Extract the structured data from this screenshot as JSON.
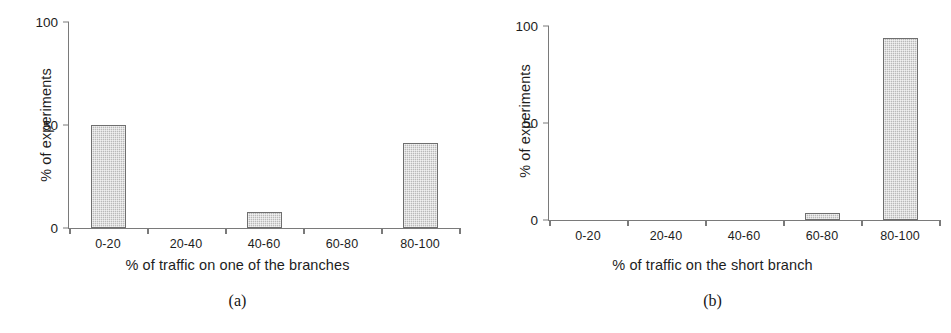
{
  "figure": {
    "panels": [
      {
        "caption": "(a)",
        "ylabel": "% of experiments",
        "xlabel": "% of traffic on one of the branches",
        "categories": [
          "0-20",
          "20-40",
          "40-60",
          "60-80",
          "80-100"
        ],
        "values": [
          50,
          0,
          8,
          0,
          41.5
        ],
        "yticks": [
          "0",
          "50",
          "100"
        ]
      },
      {
        "caption": "(b)",
        "ylabel": "% of experiments",
        "xlabel": "% of traffic on the short branch",
        "categories": [
          "0-20",
          "20-40",
          "40-60",
          "60-80",
          "80-100"
        ],
        "values": [
          0,
          0,
          0,
          3.5,
          94
        ],
        "yticks": [
          "0",
          "50",
          "100"
        ]
      }
    ]
  },
  "chart_data": [
    {
      "type": "bar",
      "panel": "(a)",
      "title": "",
      "xlabel": "% of traffic on one of the branches",
      "ylabel": "% of experiments",
      "categories": [
        "0-20",
        "20-40",
        "40-60",
        "60-80",
        "80-100"
      ],
      "values": [
        50,
        0,
        8,
        0,
        41.5
      ],
      "ylim": [
        0,
        100
      ],
      "ytick_values": [
        0,
        50,
        100
      ],
      "grid": false,
      "legend": "none",
      "bar_fill_color": "#b9b9b9",
      "bar_border_color": "#6f6f6f",
      "axis_color": "#7a7a7a"
    },
    {
      "type": "bar",
      "panel": "(b)",
      "title": "",
      "xlabel": "% of traffic on the short branch",
      "ylabel": "% of experiments",
      "categories": [
        "0-20",
        "20-40",
        "40-60",
        "60-80",
        "80-100"
      ],
      "values": [
        0,
        0,
        0,
        3.5,
        94
      ],
      "ylim": [
        0,
        100
      ],
      "ytick_values": [
        0,
        50,
        100
      ],
      "grid": false,
      "legend": "none",
      "bar_fill_color": "#b9b9b9",
      "bar_border_color": "#6f6f6f",
      "axis_color": "#7a7a7a"
    }
  ]
}
